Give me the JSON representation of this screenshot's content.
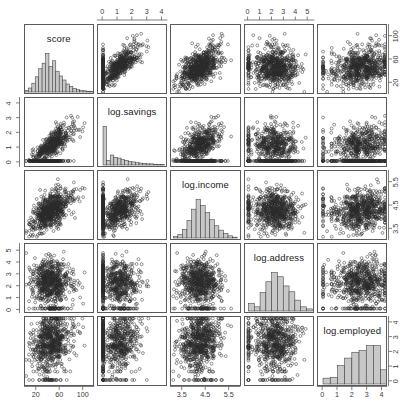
{
  "figure": {
    "type": "scatterplot-matrix",
    "caption": "",
    "panel_bg": "#ffffff",
    "border_color": "#5a5a5a",
    "hist_fill": "#c8c8c8",
    "hist_stroke": "#3c3c3c",
    "point_color": "#2a2a2a"
  },
  "variables": [
    {
      "key": "score",
      "label": "score",
      "axis_side": "bottom-left",
      "range": [
        0,
        120
      ],
      "ticks": [
        20,
        60,
        100
      ],
      "tick_labels": [
        "20",
        "60",
        "100"
      ],
      "outer_ticks_right": [
        20,
        60,
        100
      ],
      "outer_tick_labels_right": [
        "20",
        "60",
        "100"
      ]
    },
    {
      "key": "log.savings",
      "label": "log.savings",
      "range": [
        -0.35,
        4.4
      ],
      "ticks": [
        0,
        1,
        2,
        3,
        4
      ],
      "tick_labels": [
        "0",
        "1",
        "2",
        "3",
        "4"
      ]
    },
    {
      "key": "log.income",
      "label": "log.income",
      "range": [
        3.0,
        6.0
      ],
      "ticks": [
        3.5,
        4.5,
        5.5
      ],
      "tick_labels": [
        "3.5",
        "4.5",
        "5.5"
      ]
    },
    {
      "key": "log.address",
      "label": "log.address",
      "range": [
        -0.3,
        5.6
      ],
      "ticks": [
        0,
        1,
        2,
        3,
        4,
        5
      ],
      "tick_labels": [
        "0",
        "1",
        "2",
        "3",
        "4",
        "5"
      ]
    },
    {
      "key": "log.employed",
      "label": "log.employed",
      "range": [
        -0.35,
        4.4
      ],
      "ticks": [
        0,
        1,
        2,
        3,
        4
      ],
      "tick_labels": [
        "0",
        "1",
        "2",
        "3",
        "4"
      ]
    }
  ],
  "chart_data": {
    "type": "scatter",
    "title": "",
    "xlabel": "",
    "ylabel": "",
    "grid": false,
    "legend": "none",
    "matrix_order": [
      "score",
      "log.savings",
      "log.income",
      "log.address",
      "log.employed"
    ],
    "diagonal": "histogram",
    "n_points": 700,
    "axis_ranges": {
      "score": [
        0,
        120
      ],
      "log.savings": [
        -0.35,
        4.4
      ],
      "log.income": [
        3.0,
        6.0
      ],
      "log.address": [
        -0.3,
        5.6
      ],
      "log.employed": [
        -0.35,
        4.4
      ]
    },
    "tick_labels": {
      "score": [
        "20",
        "60",
        "100"
      ],
      "log.savings": [
        "0",
        "1",
        "2",
        "3",
        "4"
      ],
      "log.income": [
        "3.5",
        "4.5",
        "5.5"
      ],
      "log.address": [
        "0",
        "1",
        "2",
        "3",
        "4",
        "5"
      ],
      "log.employed": [
        "0",
        "1",
        "2",
        "3",
        "4"
      ]
    },
    "tick_values": {
      "score": [
        20,
        60,
        100
      ],
      "log.savings": [
        0,
        1,
        2,
        3,
        4
      ],
      "log.income": [
        3.5,
        4.5,
        5.5
      ],
      "log.address": [
        0,
        1,
        2,
        3,
        4,
        5
      ],
      "log.employed": [
        0,
        1,
        2,
        3,
        4
      ]
    },
    "histograms": {
      "score": {
        "bin_edges": [
          0,
          6,
          12,
          18,
          24,
          30,
          36,
          42,
          48,
          54,
          60,
          66,
          72,
          78,
          84,
          90,
          96,
          102,
          108,
          114,
          120
        ],
        "counts": [
          4,
          10,
          22,
          38,
          58,
          72,
          96,
          64,
          78,
          52,
          40,
          30,
          20,
          14,
          9,
          6,
          4,
          3,
          2,
          1
        ]
      },
      "log.savings": {
        "bin_edges": [
          0,
          0.25,
          0.5,
          0.75,
          1.0,
          1.25,
          1.5,
          1.75,
          2.0,
          2.25,
          2.5,
          2.75,
          3.0,
          3.25,
          3.5,
          3.75,
          4.0,
          4.25
        ],
        "counts": [
          100,
          12,
          26,
          20,
          18,
          14,
          12,
          9,
          8,
          6,
          5,
          4,
          3,
          3,
          2,
          1,
          1,
          1
        ]
      },
      "log.income": {
        "bin_edges": [
          3.1,
          3.3,
          3.5,
          3.7,
          3.9,
          4.1,
          4.3,
          4.5,
          4.7,
          4.9,
          5.1,
          5.3,
          5.5,
          5.7,
          5.9
        ],
        "counts": [
          3,
          8,
          20,
          40,
          66,
          88,
          74,
          58,
          42,
          28,
          18,
          10,
          5,
          2
        ]
      },
      "log.address": {
        "bin_edges": [
          0,
          0.5,
          1.0,
          1.5,
          2.0,
          2.5,
          3.0,
          3.5,
          4.0,
          4.5,
          5.0,
          5.5
        ],
        "counts": [
          18,
          10,
          44,
          70,
          92,
          82,
          60,
          46,
          26,
          10,
          5
        ]
      },
      "log.employed": {
        "bin_edges": [
          0,
          0.5,
          1.0,
          1.5,
          2.0,
          2.5,
          3.0,
          3.5,
          4.0,
          4.5
        ],
        "counts": [
          14,
          16,
          44,
          62,
          76,
          80,
          92,
          92,
          34,
          6
        ]
      }
    },
    "series": [
      {
        "name": "credit applicants",
        "description": "each point is one applicant; panels show all pairwise relationships among the five variables"
      }
    ],
    "relationships": [
      {
        "x": "log.savings",
        "y": "score",
        "trend": "positive",
        "note": "score rises with log.savings, dense cluster at low savings"
      },
      {
        "x": "log.income",
        "y": "score",
        "trend": "weak-positive"
      },
      {
        "x": "log.address",
        "y": "score",
        "trend": "none"
      },
      {
        "x": "log.employed",
        "y": "score",
        "trend": "weak-positive"
      },
      {
        "x": "score",
        "y": "log.savings",
        "trend": "positive"
      },
      {
        "x": "log.income",
        "y": "log.savings",
        "trend": "weak-positive"
      },
      {
        "x": "log.address",
        "y": "log.savings",
        "trend": "none"
      },
      {
        "x": "log.employed",
        "y": "log.savings",
        "trend": "weak-positive"
      },
      {
        "x": "score",
        "y": "log.income",
        "trend": "weak-positive"
      },
      {
        "x": "log.savings",
        "y": "log.income",
        "trend": "weak-positive"
      },
      {
        "x": "log.address",
        "y": "log.income",
        "trend": "none"
      },
      {
        "x": "log.employed",
        "y": "log.income",
        "trend": "weak-positive"
      },
      {
        "x": "score",
        "y": "log.address",
        "trend": "none"
      },
      {
        "x": "log.savings",
        "y": "log.address",
        "trend": "none"
      },
      {
        "x": "log.income",
        "y": "log.address",
        "trend": "none"
      },
      {
        "x": "log.employed",
        "y": "log.address",
        "trend": "weak-positive"
      },
      {
        "x": "score",
        "y": "log.employed",
        "trend": "weak-positive"
      },
      {
        "x": "log.savings",
        "y": "log.employed",
        "trend": "weak-positive"
      },
      {
        "x": "log.income",
        "y": "log.employed",
        "trend": "weak-positive"
      },
      {
        "x": "log.address",
        "y": "log.employed",
        "trend": "weak-positive"
      }
    ]
  }
}
